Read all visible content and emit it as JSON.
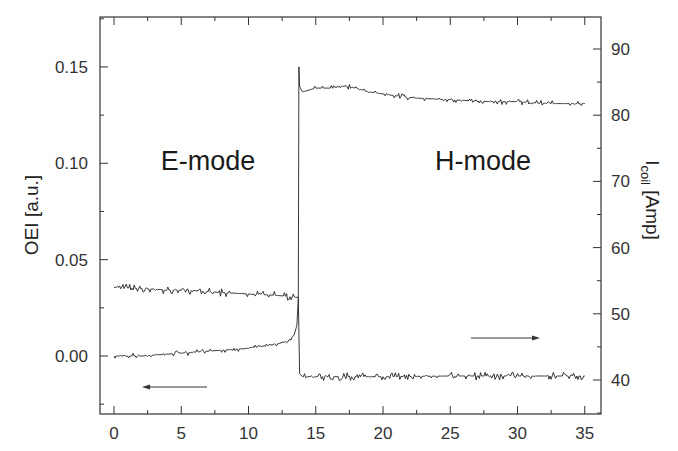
{
  "chart_data": {
    "type": "line",
    "title": "",
    "xlabel": "",
    "ylabel": "OEI [a.u.]",
    "ylabel_right": "I_coil [Amp]",
    "xlim": [
      -1,
      36
    ],
    "ylim": [
      -0.03,
      0.175
    ],
    "ylim_right": [
      34.9,
      94.8
    ],
    "x_ticks": [
      0,
      5,
      10,
      15,
      20,
      25,
      30,
      35
    ],
    "y_ticks": [
      "0.00",
      "0.05",
      "0.10",
      "0.15"
    ],
    "y_ticks_right": [
      "40",
      "50",
      "60",
      "70",
      "80",
      "90"
    ],
    "grid": false,
    "legend": [],
    "annotations": [
      {
        "text": "E-mode",
        "x": 5.5,
        "y": 0.1
      },
      {
        "text": "H-mode",
        "x": 24.5,
        "y": 0.1
      },
      {
        "text": "arrow-left (OEI → left axis)",
        "x_from": 7,
        "x_to": 2,
        "y": -0.012
      },
      {
        "text": "arrow-right (I_coil → right axis)",
        "x_from": 26.5,
        "x_to": 31.5,
        "y": 0.012
      }
    ],
    "series": [
      {
        "name": "OEI",
        "axis": "left",
        "x": [
          0,
          2,
          4,
          6,
          8,
          10,
          11,
          12,
          13,
          13.4,
          13.6,
          13.7,
          13.75,
          13.8,
          14,
          15,
          16,
          17,
          18,
          19,
          20,
          22,
          25,
          28,
          30,
          32,
          35
        ],
        "values": [
          0.0,
          0.0,
          0.001,
          0.002,
          0.003,
          0.004,
          0.005,
          0.006,
          0.008,
          0.011,
          0.016,
          0.03,
          0.15,
          0.14,
          0.137,
          0.139,
          0.139,
          0.14,
          0.139,
          0.137,
          0.136,
          0.134,
          0.133,
          0.132,
          0.132,
          0.131,
          0.131
        ]
      },
      {
        "name": "I_coil",
        "axis": "right",
        "x": [
          0,
          2,
          4,
          6,
          8,
          10,
          12,
          13.5,
          13.7,
          13.8,
          14,
          16,
          18,
          20,
          25,
          30,
          35
        ],
        "values": [
          54.0,
          53.8,
          53.6,
          53.5,
          53.2,
          53.0,
          52.8,
          52.5,
          52.5,
          41.0,
          40.5,
          40.5,
          40.5,
          40.5,
          40.6,
          40.6,
          40.6
        ]
      }
    ]
  },
  "labels": {
    "e_mode": "E-mode",
    "h_mode": "H-mode",
    "ylabel_left": "OEI [a.u.]",
    "ylabel_right_main": "I",
    "ylabel_right_sub": "coil",
    "ylabel_right_unit": " [Amp]"
  }
}
